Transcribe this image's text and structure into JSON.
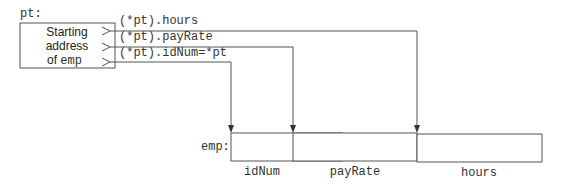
{
  "diagram": {
    "pointer": {
      "label": "pt:",
      "box_lines": [
        "Starting",
        "address"
      ],
      "box_line3_prefix": "of ",
      "box_line3_code": "emp"
    },
    "accessors": [
      {
        "label": "(*pt).hours",
        "target": "hours"
      },
      {
        "label": "(*pt).payRate",
        "target": "payRate"
      },
      {
        "label": "(*pt).idNum=*pt",
        "target": "idNum"
      }
    ],
    "struct": {
      "label": "emp:",
      "fields": [
        "idNum",
        "payRate",
        "hours"
      ]
    }
  }
}
